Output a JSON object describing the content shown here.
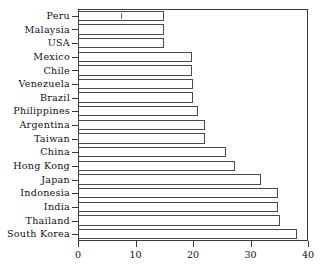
{
  "chart_data": {
    "type": "bar",
    "orientation": "horizontal",
    "title": "",
    "xlabel": "",
    "ylabel": "",
    "xlim": [
      0,
      40
    ],
    "xticks": [
      0,
      10,
      20,
      30,
      40
    ],
    "grid": false,
    "legend": null,
    "categories": [
      "Peru",
      "Malaysia",
      "USA",
      "Mexico",
      "Chile",
      "Venezuela",
      "Brazil",
      "Philippines",
      "Argentina",
      "Taiwan",
      "China",
      "Hong Kong",
      "Japan",
      "Indonesia",
      "India",
      "Thailand",
      "South Korea"
    ],
    "values": [
      15,
      15,
      15,
      19.8,
      19.8,
      20,
      20,
      20.8,
      22,
      22,
      25.7,
      27.3,
      31.8,
      34.8,
      34.8,
      35.2,
      38
    ],
    "bar_facecolor": "#ffffff",
    "bar_edgecolor": "#4a4a4a",
    "axis_color": "#3a3a3a"
  },
  "axis": {
    "x_tick_labels": [
      "0",
      "10",
      "20",
      "30",
      "40"
    ]
  }
}
